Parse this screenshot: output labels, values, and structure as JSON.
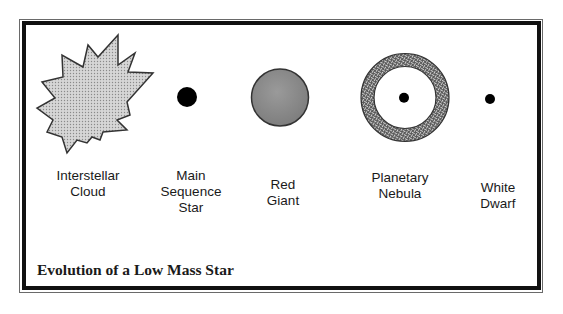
{
  "diagram": {
    "caption": "Evolution of a Low Mass Star",
    "stages": [
      {
        "id": "interstellar-cloud",
        "lines": [
          "Interstellar",
          "Cloud"
        ],
        "shape": "starburst",
        "fill": "#c8c8c8"
      },
      {
        "id": "main-sequence-star",
        "lines": [
          "Main",
          "Sequence",
          "Star"
        ],
        "shape": "filled-dot",
        "fill": "#000000"
      },
      {
        "id": "red-giant",
        "lines": [
          "Red",
          "Giant"
        ],
        "shape": "large-circle",
        "fill": "#8f8f8f"
      },
      {
        "id": "planetary-nebula",
        "lines": [
          "Planetary",
          "Nebula"
        ],
        "shape": "ring-with-dot",
        "fill": "#6e6e6e"
      },
      {
        "id": "white-dwarf",
        "lines": [
          "White",
          "Dwarf"
        ],
        "shape": "small-dot",
        "fill": "#000000"
      }
    ],
    "colors": {
      "frame": "#111111",
      "background": "#ffffff",
      "text": "#1a1a1a"
    }
  }
}
